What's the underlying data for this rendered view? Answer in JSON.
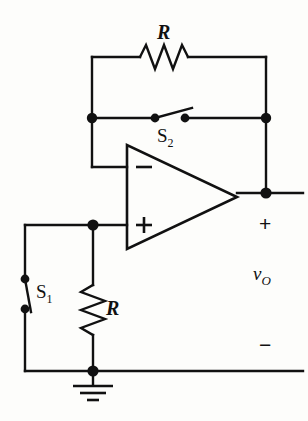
{
  "figure": {
    "type": "schematic",
    "width": 308,
    "height": 421,
    "background_color": "#fdfdfb",
    "line_color": "#111111"
  },
  "labels": {
    "resistor_feedback": "R",
    "resistor_input": "R",
    "switch_feedback": "S",
    "switch_feedback_sub": "2",
    "switch_input": "S",
    "switch_input_sub": "1",
    "output_voltage": "v",
    "output_voltage_sub": "O",
    "output_plus": "+",
    "output_minus": "−",
    "opamp_inverting": "−",
    "opamp_noninverting": "+"
  },
  "components": [
    {
      "name": "feedback-resistor",
      "kind": "resistor",
      "label": "R",
      "orientation": "horizontal",
      "x1": 140,
      "x2": 192,
      "y": 57
    },
    {
      "name": "input-resistor",
      "kind": "resistor",
      "label": "R",
      "orientation": "vertical",
      "x": 93,
      "y1": 285,
      "y2": 337
    },
    {
      "name": "feedback-switch",
      "kind": "switch",
      "label": "S2",
      "state": "open",
      "orientation": "horizontal",
      "contact_a": [
        155,
        118
      ],
      "contact_b": [
        185,
        118
      ]
    },
    {
      "name": "input-switch",
      "kind": "switch",
      "label": "S1",
      "state": "open",
      "orientation": "vertical",
      "contact_a": [
        25,
        279
      ],
      "contact_b": [
        25,
        309
      ]
    },
    {
      "name": "operational-amplifier",
      "kind": "opamp",
      "left_edge_x": 127,
      "top_y": 145,
      "bottom_y": 249,
      "apex_x": 237,
      "apex_y": 197,
      "inverting_input_y": 167,
      "noninverting_input_y": 225
    },
    {
      "name": "ground-symbol",
      "kind": "ground",
      "x": 93,
      "y": 371
    }
  ],
  "nodes": [
    {
      "name": "inverting-node",
      "x": 93,
      "y": 118
    },
    {
      "name": "output-node-upper",
      "x": 266,
      "y": 118
    },
    {
      "name": "output-node",
      "x": 266,
      "y": 193
    },
    {
      "name": "noninverting-node",
      "x": 93,
      "y": 225
    },
    {
      "name": "ground-node",
      "x": 93,
      "y": 371
    },
    {
      "name": "s2-contact-left",
      "x": 155,
      "y": 118
    },
    {
      "name": "s2-contact-right",
      "x": 185,
      "y": 118
    },
    {
      "name": "s1-contact-top",
      "x": 25,
      "y": 279
    },
    {
      "name": "s1-contact-bottom",
      "x": 25,
      "y": 309
    }
  ]
}
